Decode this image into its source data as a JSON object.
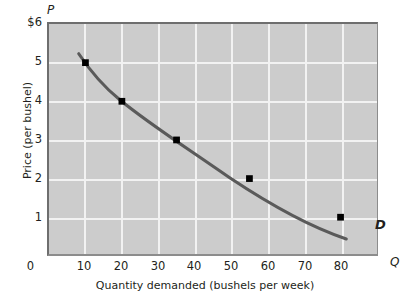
{
  "chart_data": {
    "type": "line",
    "title": "",
    "xlabel": "Quantity demanded (bushels per week)",
    "ylabel": "Price (per bushel)",
    "x_axis_symbol": "Q",
    "y_axis_symbol": "P",
    "xlim": [
      0,
      90
    ],
    "ylim": [
      0,
      6
    ],
    "grid": true,
    "legend_position": "inline-end-of-curve",
    "series": [
      {
        "name": "D",
        "annotation": "D",
        "x": [
          10,
          20,
          35,
          55,
          80
        ],
        "values": [
          5,
          4,
          3,
          2,
          1
        ],
        "points": [
          {
            "x": 10,
            "y": 5
          },
          {
            "x": 20,
            "y": 4
          },
          {
            "x": 35,
            "y": 3
          },
          {
            "x": 55,
            "y": 2
          },
          {
            "x": 80,
            "y": 1
          }
        ]
      }
    ],
    "y_ticks": [
      {
        "value": 6,
        "label": "$6"
      },
      {
        "value": 5,
        "label": "5"
      },
      {
        "value": 4,
        "label": "4"
      },
      {
        "value": 3,
        "label": "3"
      },
      {
        "value": 2,
        "label": "2"
      },
      {
        "value": 1,
        "label": "1"
      },
      {
        "value": 0,
        "label": "0"
      }
    ],
    "x_ticks": [
      {
        "value": 0,
        "label": "0"
      },
      {
        "value": 10,
        "label": "10"
      },
      {
        "value": 20,
        "label": "20"
      },
      {
        "value": 30,
        "label": "30"
      },
      {
        "value": 40,
        "label": "40"
      },
      {
        "value": 50,
        "label": "50"
      },
      {
        "value": 60,
        "label": "60"
      },
      {
        "value": 70,
        "label": "70"
      },
      {
        "value": 80,
        "label": "80"
      }
    ],
    "colors": {
      "plot_background": "#cccccc",
      "gridline": "#f2f2f2",
      "curve": "#5a5a5a",
      "point": "#000000",
      "text": "#231f20",
      "page_background": "#ffffff"
    }
  }
}
